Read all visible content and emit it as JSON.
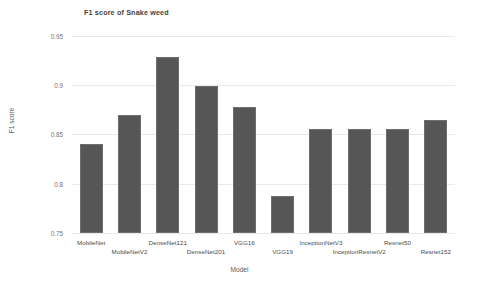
{
  "chart_data": {
    "type": "bar",
    "title": "F1 score of Snake weed",
    "xlabel": "Model",
    "ylabel": "F1 score",
    "ylim": [
      0.75,
      0.955
    ],
    "yticks": [
      0.75,
      0.8,
      0.85,
      0.9,
      0.95
    ],
    "ytick_labels": [
      "0.75",
      "0.8",
      "0.85",
      "0.9",
      "0.95"
    ],
    "grid": true,
    "legend": "none",
    "bar_color": "#565656",
    "categories": [
      "MobileNet",
      "MobileNetV2",
      "DenseNet121",
      "DenseNet201",
      "VGG16",
      "VGG19",
      "InceptionNetV3",
      "InceptionResnetV2",
      "Resnet50",
      "Resnet152"
    ],
    "values": [
      0.84,
      0.87,
      0.929,
      0.899,
      0.878,
      0.788,
      0.856,
      0.856,
      0.856,
      0.865
    ]
  }
}
